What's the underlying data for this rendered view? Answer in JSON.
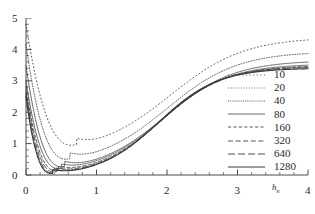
{
  "chart_data": {
    "type": "line",
    "title": "",
    "xlabel": "h_n",
    "xlabel_base": "h",
    "xlabel_sub": "n",
    "ylabel": "",
    "xlim": [
      0,
      4
    ],
    "ylim": [
      0,
      5
    ],
    "xticks": [
      0,
      1,
      2,
      3,
      4
    ],
    "xtick_labels": [
      "0",
      "1",
      "2",
      "3",
      "4"
    ],
    "yticks": [
      0,
      1,
      2,
      3,
      4,
      5
    ],
    "ytick_labels": [
      "0",
      "1",
      "2",
      "3",
      "4",
      "5"
    ],
    "minor_ticks_per_interval": 5,
    "grid": false,
    "legend_position": "right-middle",
    "legend_title": "",
    "line_color": "#3a3a3a",
    "axis_color": "#4a4a4a",
    "series": [
      {
        "name": "10",
        "dash": "1,2.6",
        "width": 0.85,
        "x0_value": 5.0,
        "min_x": 0.72,
        "min_y": 0.97,
        "plateau": 4.65,
        "rise_center": 2.05,
        "rise_width": 0.52,
        "values": [
          5.0,
          3.2,
          2.05,
          1.45,
          1.15,
          1.0,
          0.97,
          1.0,
          1.1,
          1.28,
          1.5,
          1.78,
          2.1,
          2.45,
          2.82,
          3.2,
          3.6,
          3.96,
          4.24,
          4.44,
          4.56,
          4.62,
          4.65,
          4.66,
          4.66,
          4.66,
          4.66
        ]
      },
      {
        "name": "20",
        "dash": "0.9,1.7",
        "width": 0.85,
        "x0_value": 4.3,
        "min_x": 0.62,
        "min_y": 0.52,
        "plateau": 4.15,
        "rise_center": 2.0,
        "rise_width": 0.5,
        "values": [
          4.3,
          2.2,
          1.2,
          0.75,
          0.58,
          0.52,
          0.53,
          0.58,
          0.68,
          0.85,
          1.08,
          1.36,
          1.68,
          2.04,
          2.42,
          2.8,
          3.2,
          3.56,
          3.83,
          4.0,
          4.09,
          4.13,
          4.15,
          4.15,
          4.15,
          4.15,
          4.15
        ]
      },
      {
        "name": "40",
        "dash": "0.9,1.0",
        "width": 0.85,
        "x0_value": 3.6,
        "min_x": 0.55,
        "min_y": 0.27,
        "plateau": 3.82,
        "rise_center": 1.98,
        "rise_width": 0.48,
        "values": [
          3.6,
          1.5,
          0.7,
          0.4,
          0.3,
          0.27,
          0.28,
          0.33,
          0.42,
          0.58,
          0.8,
          1.07,
          1.4,
          1.76,
          2.14,
          2.53,
          2.92,
          3.25,
          3.52,
          3.69,
          3.77,
          3.81,
          3.82,
          3.82,
          3.82,
          3.82,
          3.82
        ]
      },
      {
        "name": "80",
        "dash": "",
        "width": 0.75,
        "x0_value": 3.1,
        "min_x": 0.5,
        "min_y": 0.21,
        "plateau": 3.68,
        "rise_center": 1.95,
        "rise_width": 0.46,
        "values": [
          3.1,
          1.1,
          0.48,
          0.28,
          0.22,
          0.21,
          0.22,
          0.27,
          0.36,
          0.5,
          0.7,
          0.97,
          1.3,
          1.67,
          2.06,
          2.45,
          2.83,
          3.15,
          3.42,
          3.58,
          3.65,
          3.67,
          3.68,
          3.68,
          3.68,
          3.68,
          3.68
        ]
      },
      {
        "name": "160",
        "dash": "3.2,2.2",
        "width": 0.85,
        "x0_value": 2.9,
        "min_x": 0.46,
        "min_y": 0.14,
        "plateau": 3.62,
        "rise_center": 1.93,
        "rise_width": 0.45,
        "values": [
          2.9,
          0.85,
          0.34,
          0.19,
          0.15,
          0.14,
          0.15,
          0.19,
          0.28,
          0.41,
          0.6,
          0.87,
          1.2,
          1.58,
          1.98,
          2.38,
          2.76,
          3.09,
          3.36,
          3.52,
          3.59,
          3.61,
          3.62,
          3.62,
          3.62,
          3.62,
          3.62
        ]
      },
      {
        "name": "320",
        "dash": "5,2.6",
        "width": 0.85,
        "x0_value": 2.75,
        "min_x": 0.43,
        "min_y": 0.1,
        "plateau": 3.58,
        "rise_center": 1.92,
        "rise_width": 0.44,
        "values": [
          2.75,
          0.68,
          0.25,
          0.13,
          0.1,
          0.1,
          0.11,
          0.15,
          0.23,
          0.35,
          0.54,
          0.8,
          1.13,
          1.52,
          1.92,
          2.32,
          2.71,
          3.05,
          3.32,
          3.48,
          3.55,
          3.57,
          3.58,
          3.58,
          3.58,
          3.58,
          3.58
        ]
      },
      {
        "name": "640",
        "dash": "7,3",
        "width": 0.9,
        "x0_value": 2.65,
        "min_x": 0.4,
        "min_y": 0.07,
        "plateau": 3.55,
        "rise_center": 1.9,
        "rise_width": 0.43,
        "values": [
          2.65,
          0.55,
          0.18,
          0.09,
          0.07,
          0.07,
          0.08,
          0.11,
          0.18,
          0.29,
          0.47,
          0.73,
          1.06,
          1.45,
          1.86,
          2.27,
          2.66,
          3.01,
          3.29,
          3.45,
          3.52,
          3.54,
          3.55,
          3.55,
          3.55,
          3.55,
          3.55
        ]
      },
      {
        "name": "1280",
        "dash": "",
        "width": 1.15,
        "x0_value": 2.55,
        "min_x": 0.38,
        "min_y": 0.05,
        "plateau": 3.5,
        "rise_center": 1.88,
        "rise_width": 0.42,
        "values": [
          2.55,
          0.45,
          0.14,
          0.07,
          0.05,
          0.05,
          0.06,
          0.08,
          0.14,
          0.24,
          0.41,
          0.66,
          0.99,
          1.39,
          1.8,
          2.22,
          2.62,
          2.97,
          3.25,
          3.41,
          3.47,
          3.49,
          3.5,
          3.5,
          3.5,
          3.5,
          3.5
        ]
      }
    ]
  }
}
